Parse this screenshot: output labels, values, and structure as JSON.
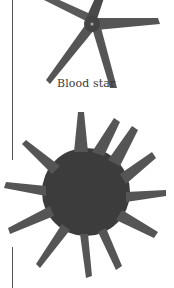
{
  "page": {
    "figures": [
      {
        "name": "blood-star",
        "caption": "Blood star"
      },
      {
        "name": "sun-star",
        "caption": ""
      }
    ]
  }
}
